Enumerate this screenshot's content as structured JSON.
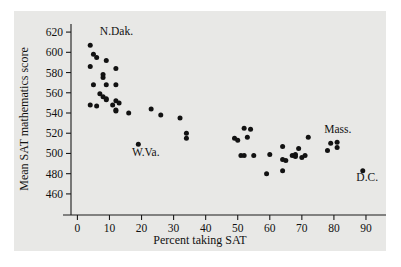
{
  "chart_data": {
    "type": "scatter",
    "title": "",
    "xlabel": "Percent taking SAT",
    "ylabel": "Mean SAT mathematics score",
    "xlim": [
      -2,
      95
    ],
    "ylim": [
      452,
      628
    ],
    "xticks": [
      0,
      10,
      20,
      30,
      40,
      50,
      60,
      70,
      80,
      90
    ],
    "yticks": [
      460,
      480,
      500,
      520,
      540,
      560,
      580,
      600,
      620
    ],
    "grid": false,
    "legend": null,
    "marker": "filled-circle",
    "marker_color": "#121212",
    "points": [
      {
        "x": 4,
        "y": 607
      },
      {
        "x": 5,
        "y": 598
      },
      {
        "x": 6,
        "y": 595
      },
      {
        "x": 9,
        "y": 592
      },
      {
        "x": 4,
        "y": 586
      },
      {
        "x": 12,
        "y": 584
      },
      {
        "x": 8,
        "y": 578
      },
      {
        "x": 8,
        "y": 575
      },
      {
        "x": 5,
        "y": 568
      },
      {
        "x": 9,
        "y": 568
      },
      {
        "x": 12,
        "y": 568
      },
      {
        "x": 7,
        "y": 559
      },
      {
        "x": 8,
        "y": 556
      },
      {
        "x": 9,
        "y": 554
      },
      {
        "x": 9,
        "y": 553
      },
      {
        "x": 12,
        "y": 552
      },
      {
        "x": 13,
        "y": 550
      },
      {
        "x": 11,
        "y": 548
      },
      {
        "x": 4,
        "y": 548
      },
      {
        "x": 6,
        "y": 547
      },
      {
        "x": 12,
        "y": 543
      },
      {
        "x": 12,
        "y": 542
      },
      {
        "x": 16,
        "y": 540
      },
      {
        "x": 23,
        "y": 544
      },
      {
        "x": 26,
        "y": 538
      },
      {
        "x": 32,
        "y": 535
      },
      {
        "x": 34,
        "y": 520
      },
      {
        "x": 34,
        "y": 515
      },
      {
        "x": 19,
        "y": 509
      },
      {
        "x": 52,
        "y": 525
      },
      {
        "x": 54,
        "y": 524
      },
      {
        "x": 49,
        "y": 515
      },
      {
        "x": 50,
        "y": 513
      },
      {
        "x": 53,
        "y": 516
      },
      {
        "x": 51,
        "y": 498
      },
      {
        "x": 52,
        "y": 498
      },
      {
        "x": 55,
        "y": 498
      },
      {
        "x": 60,
        "y": 499
      },
      {
        "x": 59,
        "y": 480
      },
      {
        "x": 64,
        "y": 483
      },
      {
        "x": 64,
        "y": 507
      },
      {
        "x": 64,
        "y": 494
      },
      {
        "x": 65,
        "y": 493
      },
      {
        "x": 67,
        "y": 498
      },
      {
        "x": 68,
        "y": 499
      },
      {
        "x": 68,
        "y": 497
      },
      {
        "x": 69,
        "y": 505
      },
      {
        "x": 70,
        "y": 496
      },
      {
        "x": 71,
        "y": 498
      },
      {
        "x": 72,
        "y": 516
      },
      {
        "x": 78,
        "y": 503
      },
      {
        "x": 79,
        "y": 510
      },
      {
        "x": 81,
        "y": 511
      },
      {
        "x": 81,
        "y": 506
      },
      {
        "x": 89,
        "y": 483
      }
    ],
    "annotations": [
      {
        "text": "N.Dak.",
        "x": 7,
        "y": 617
      },
      {
        "text": "W.Va.",
        "x": 17,
        "y": 497
      },
      {
        "text": "Mass.",
        "x": 77,
        "y": 520
      },
      {
        "text": "D.C.",
        "x": 87,
        "y": 473
      }
    ]
  }
}
